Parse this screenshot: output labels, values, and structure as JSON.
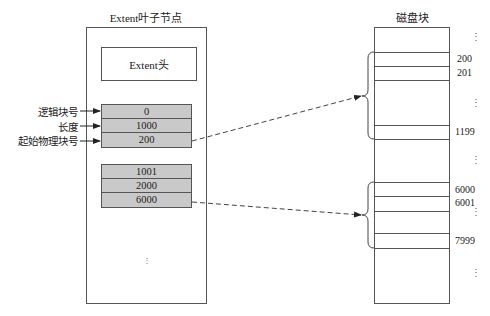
{
  "left": {
    "title": "Extent叶子节点",
    "header_label": "Extent头",
    "extents": [
      {
        "logical_block": "0",
        "length": "1000",
        "start_physical_block": "200"
      },
      {
        "logical_block": "1001",
        "length": "2000",
        "start_physical_block": "6000"
      }
    ],
    "field_labels": [
      "逻辑块号",
      "长度",
      "起始物理块号"
    ],
    "ellipsis": "⋮"
  },
  "right": {
    "title": "磁盘块",
    "labels": [
      {
        "text": "⋮",
        "y": 33
      },
      {
        "text": "200",
        "y": 53
      },
      {
        "text": "201",
        "y": 67
      },
      {
        "text": "⋮",
        "y": 99
      },
      {
        "text": "1199",
        "y": 126
      },
      {
        "text": "⋮",
        "y": 156
      },
      {
        "text": "6000",
        "y": 184
      },
      {
        "text": "6001",
        "y": 197
      },
      {
        "text": "⋮",
        "y": 208
      },
      {
        "text": "7999",
        "y": 235
      },
      {
        "text": "⋮",
        "y": 269
      }
    ]
  },
  "colors": {
    "line": "#555555",
    "cell_fill": "#c9c9c9"
  }
}
